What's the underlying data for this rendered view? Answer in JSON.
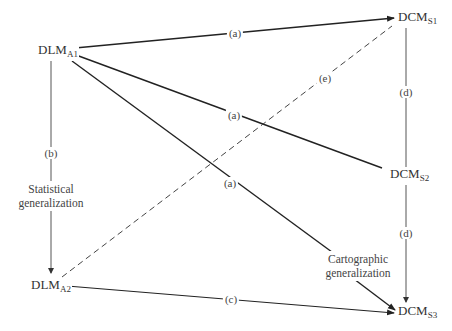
{
  "nodes": {
    "dlm_a1": {
      "main": "DLM",
      "sub": "A1"
    },
    "dlm_a2": {
      "main": "DLM",
      "sub": "A2"
    },
    "dcm_s1": {
      "main": "DCM",
      "sub": "S1"
    },
    "dcm_s2": {
      "main": "DCM",
      "sub": "S2"
    },
    "dcm_s3": {
      "main": "DCM",
      "sub": "S3"
    }
  },
  "edges": [
    {
      "id": "a1_s1",
      "from": "DLM_A1",
      "to": "DCM_S1",
      "label": "(a)",
      "style": "solid",
      "arrow": true
    },
    {
      "id": "a1_s2",
      "from": "DLM_A1",
      "to": "DCM_S2",
      "label": "(a)",
      "style": "solid",
      "arrow": false
    },
    {
      "id": "a1_s3",
      "from": "DLM_A1",
      "to": "DCM_S3",
      "label": "(a)",
      "style": "solid",
      "arrow": true
    },
    {
      "id": "a1_a2",
      "from": "DLM_A1",
      "to": "DLM_A2",
      "label": "(b)",
      "style": "solid",
      "arrow": true
    },
    {
      "id": "a2_s3",
      "from": "DLM_A2",
      "to": "DCM_S3",
      "label": "(c)",
      "style": "solid",
      "arrow": true
    },
    {
      "id": "s1_s2",
      "from": "DCM_S1",
      "to": "DCM_S2",
      "label": "(d)",
      "style": "solid",
      "arrow": false
    },
    {
      "id": "s2_s3",
      "from": "DCM_S2",
      "to": "DCM_S3",
      "label": "(d)",
      "style": "solid",
      "arrow": true
    },
    {
      "id": "a2_s1",
      "from": "DLM_A2",
      "to": "DCM_S1",
      "label": "(e)",
      "style": "dashed",
      "arrow": false
    }
  ],
  "annotations": {
    "statistical": [
      "Statistical",
      "generalization"
    ],
    "cartographic": [
      "Cartographic",
      "generalization"
    ]
  },
  "colors": {
    "line": "#2a2a2a",
    "thin_line": "#555555",
    "text": "#333333"
  }
}
